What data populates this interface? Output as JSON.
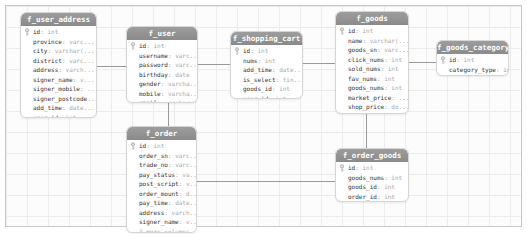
{
  "diagram": {
    "type": "database-er-diagram",
    "colors": {
      "header_bg": "#929292",
      "header_text": "#ffffff",
      "column_name": "#333333",
      "column_type": "#a8a8a8",
      "connector": "#9a9a9a",
      "grid": "#ececec"
    }
  },
  "tables": {
    "user_address": {
      "name": "f_user_address",
      "columns": [
        {
          "name": "id",
          "type": ": int",
          "pk": true
        },
        {
          "name": "province",
          "type": ": varc..."
        },
        {
          "name": "city",
          "type": ": varchar(..."
        },
        {
          "name": "district",
          "type": ": varc..."
        },
        {
          "name": "address",
          "type": ": varch..."
        },
        {
          "name": "signer_name",
          "type": ": v..."
        },
        {
          "name": "signer_mobile",
          "type": ": ..."
        },
        {
          "name": "signer_postcode",
          "type": "..."
        },
        {
          "name": "add_time",
          "type": ": date..."
        },
        {
          "name": "user_id",
          "type": ": int"
        }
      ]
    },
    "user": {
      "name": "f_user",
      "columns": [
        {
          "name": "id",
          "type": ": int",
          "pk": true
        },
        {
          "name": "username",
          "type": ": varc..."
        },
        {
          "name": "password",
          "type": ": varc..."
        },
        {
          "name": "birthday",
          "type": ": date"
        },
        {
          "name": "gender",
          "type": ": varcha..."
        },
        {
          "name": "mobile",
          "type": ": varcha..."
        },
        {
          "name": "email",
          "type": ": varchar..."
        }
      ]
    },
    "shopping_cart": {
      "name": "f_shopping_cart",
      "columns": [
        {
          "name": "id",
          "type": ": int",
          "pk": true
        },
        {
          "name": "nums",
          "type": ": int"
        },
        {
          "name": "add_time",
          "type": ": date..."
        },
        {
          "name": "is_select",
          "type": ": tin..."
        },
        {
          "name": "goods_id",
          "type": ": int"
        },
        {
          "name": "user_id",
          "type": ": int"
        }
      ]
    },
    "goods": {
      "name": "f_goods",
      "columns": [
        {
          "name": "id",
          "type": ": int",
          "pk": true
        },
        {
          "name": "name",
          "type": ": varchar(..."
        },
        {
          "name": "goods_sn",
          "type": ": varc..."
        },
        {
          "name": "click_nums",
          "type": ": int"
        },
        {
          "name": "sold_nums",
          "type": ": int"
        },
        {
          "name": "fav_nums",
          "type": ": int"
        },
        {
          "name": "goods_nums",
          "type": ": int"
        },
        {
          "name": "market_price",
          "type": ": ..."
        },
        {
          "name": "shop_price",
          "type": ": do..."
        }
      ],
      "more": "8 more columns..."
    },
    "goods_category": {
      "name": "f_goods_category",
      "columns": [
        {
          "name": "id",
          "type": ": int",
          "pk": true
        },
        {
          "name": "category_type",
          "type": ": int"
        },
        {
          "name": "category_front_",
          "type": "..."
        }
      ]
    },
    "order": {
      "name": "f_order",
      "columns": [
        {
          "name": "id",
          "type": ": int",
          "pk": true
        },
        {
          "name": "order_sn",
          "type": ": varc..."
        },
        {
          "name": "trade_no",
          "type": ": varc..."
        },
        {
          "name": "pay_status",
          "type": ": va..."
        },
        {
          "name": "post_script",
          "type": ": v..."
        },
        {
          "name": "order_mount",
          "type": ": d..."
        },
        {
          "name": "pay_time",
          "type": ": date..."
        },
        {
          "name": "address",
          "type": ": varch..."
        },
        {
          "name": "signer_name",
          "type": ": v..."
        }
      ],
      "more": "3 more columns..."
    },
    "order_goods": {
      "name": "f_order_goods",
      "columns": [
        {
          "name": "id",
          "type": ": int",
          "pk": true
        },
        {
          "name": "goods_nums",
          "type": ": int"
        },
        {
          "name": "goods_id",
          "type": ": int"
        },
        {
          "name": "order_id",
          "type": ": int"
        }
      ]
    }
  },
  "relations": [
    {
      "from": "f_user_address",
      "to": "f_user"
    },
    {
      "from": "f_user",
      "to": "f_shopping_cart"
    },
    {
      "from": "f_shopping_cart",
      "to": "f_goods"
    },
    {
      "from": "f_goods",
      "to": "f_goods_category"
    },
    {
      "from": "f_user",
      "to": "f_order"
    },
    {
      "from": "f_goods",
      "to": "f_order_goods"
    },
    {
      "from": "f_order",
      "to": "f_order_goods"
    }
  ]
}
